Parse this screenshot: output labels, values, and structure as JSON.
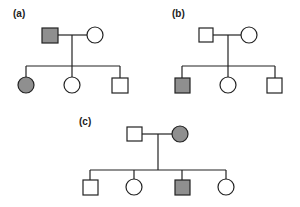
{
  "colors": {
    "affected": "#8f8f8f",
    "unaffected": "#ffffff",
    "stroke": "#222222"
  },
  "pedigrees": [
    {
      "label": "(a)",
      "parents": [
        {
          "sex": "male",
          "affected": true
        },
        {
          "sex": "female",
          "affected": false
        }
      ],
      "children": [
        {
          "sex": "female",
          "affected": true
        },
        {
          "sex": "female",
          "affected": false
        },
        {
          "sex": "male",
          "affected": false
        }
      ]
    },
    {
      "label": "(b)",
      "parents": [
        {
          "sex": "male",
          "affected": false
        },
        {
          "sex": "female",
          "affected": false
        }
      ],
      "children": [
        {
          "sex": "male",
          "affected": true
        },
        {
          "sex": "female",
          "affected": false
        },
        {
          "sex": "male",
          "affected": false
        }
      ]
    },
    {
      "label": "(c)",
      "parents": [
        {
          "sex": "male",
          "affected": false
        },
        {
          "sex": "female",
          "affected": true
        }
      ],
      "children": [
        {
          "sex": "male",
          "affected": false
        },
        {
          "sex": "female",
          "affected": false
        },
        {
          "sex": "male",
          "affected": true
        },
        {
          "sex": "female",
          "affected": false
        }
      ]
    }
  ]
}
